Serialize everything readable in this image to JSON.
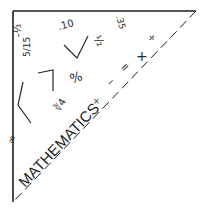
{
  "illustration": {
    "subject": "Mathematics corner triangle",
    "title": "MATHEMATICS",
    "colors": {
      "line": "#1e1e1e",
      "background": "#ffffff"
    },
    "symbols": {
      "neg_third": "-⅓",
      "five_fifteenths": "5/15",
      "point_ten": ".10",
      "point_thirtyfive": ".35",
      "half": "½",
      "percent": "%",
      "cube_root_four": "∛4",
      "infinity": "∞",
      "multiply_small": "×",
      "minus": "−",
      "equals": "=",
      "plus": "+",
      "divide": "÷"
    },
    "icons": [
      "square-root-sign",
      "square-root-sign",
      "square-root-sign"
    ]
  }
}
